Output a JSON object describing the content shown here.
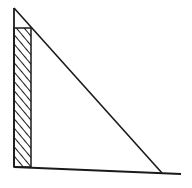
{
  "diagram": {
    "colors": {
      "stroke": "#1a1a1a",
      "background": "#ffffff",
      "hatch": "#1a1a1a"
    },
    "triangle": {
      "apex": [
        14,
        8
      ],
      "right_angle_corner": [
        14,
        167
      ],
      "base_end": [
        162,
        173
      ]
    },
    "base_line": {
      "from": [
        14,
        167
      ],
      "to": [
        181,
        174
      ]
    },
    "hatched_rect": {
      "x": 14,
      "y": 28,
      "width": 17,
      "height": 139,
      "pattern": "diagonal"
    }
  }
}
